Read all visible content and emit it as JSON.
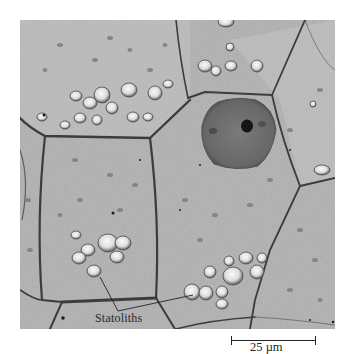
{
  "figure": {
    "type": "transmission electron micrograph",
    "annotation": {
      "label": "Statoliths",
      "leader_lines": 2
    },
    "scale_bar": {
      "label": "25 µm",
      "value": 25,
      "unit": "µm"
    }
  },
  "colors": {
    "background": "#ffffff",
    "cytoplasm": "#b8b8b8",
    "cell_wall": "#3a3a3a",
    "nucleus": "#6f6f6f",
    "nucleolus": "#1a1a1a",
    "statolith_fill": "#e8e8e8",
    "text": "#222222"
  }
}
